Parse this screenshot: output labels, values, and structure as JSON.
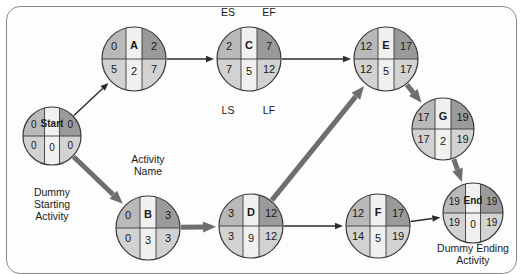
{
  "diagram": {
    "type": "pert-cpm-activity-on-node-network",
    "colors": {
      "quadrant_top_left": "#b9b9b9",
      "quadrant_top_right": "#9a9a9a",
      "quadrant_bottom_left": "#d2d2d2",
      "quadrant_bottom_right": "#d2d2d2",
      "center_band": "#f0f0ee",
      "node_outline": "#3a3a3a",
      "edge_normal": "#2b2b2b",
      "edge_critical": "#6e6e6e",
      "frame_border": "#8a8a8a",
      "page_background": "#ffffff",
      "text": "#1a1a1a"
    }
  },
  "nodes": [
    {
      "id": "start",
      "name": "Start",
      "duration": "0",
      "es": "0",
      "ef": "0",
      "ls": "0",
      "lf": "0",
      "cx": 52,
      "cy": 136,
      "r": 29,
      "critical": true
    },
    {
      "id": "a",
      "name": "A",
      "duration": "2",
      "es": "0",
      "ef": "2",
      "ls": "5",
      "lf": "7",
      "cx": 134,
      "cy": 59,
      "r": 32,
      "critical": false
    },
    {
      "id": "b",
      "name": "B",
      "duration": "3",
      "es": "0",
      "ef": "3",
      "ls": "0",
      "lf": "3",
      "cx": 148,
      "cy": 228,
      "r": 32,
      "critical": true
    },
    {
      "id": "c",
      "name": "C",
      "duration": "5",
      "es": "2",
      "ef": "7",
      "ls": "7",
      "lf": "12",
      "cx": 249,
      "cy": 59,
      "r": 32,
      "critical": false
    },
    {
      "id": "d",
      "name": "D",
      "duration": "9",
      "es": "3",
      "ef": "12",
      "ls": "3",
      "lf": "12",
      "cx": 251,
      "cy": 226,
      "r": 32,
      "critical": true
    },
    {
      "id": "e",
      "name": "E",
      "duration": "5",
      "es": "12",
      "ef": "17",
      "ls": "12",
      "lf": "17",
      "cx": 386,
      "cy": 59,
      "r": 32,
      "critical": true
    },
    {
      "id": "f",
      "name": "F",
      "duration": "5",
      "es": "12",
      "ef": "17",
      "ls": "14",
      "lf": "19",
      "cx": 378,
      "cy": 226,
      "r": 32,
      "critical": false
    },
    {
      "id": "g",
      "name": "G",
      "duration": "2",
      "es": "17",
      "ef": "19",
      "ls": "17",
      "lf": "19",
      "cx": 443,
      "cy": 129,
      "r": 31,
      "critical": true
    },
    {
      "id": "end",
      "name": "End",
      "duration": "0",
      "es": "19",
      "ef": "19",
      "ls": "19",
      "lf": "19",
      "cx": 473,
      "cy": 213,
      "r": 30,
      "critical": true
    }
  ],
  "edges": [
    {
      "from": "start",
      "to": "a",
      "critical": false
    },
    {
      "from": "start",
      "to": "b",
      "critical": true
    },
    {
      "from": "a",
      "to": "c",
      "critical": false
    },
    {
      "from": "c",
      "to": "e",
      "critical": false
    },
    {
      "from": "b",
      "to": "d",
      "critical": true
    },
    {
      "from": "d",
      "to": "e",
      "critical": true
    },
    {
      "from": "d",
      "to": "f",
      "critical": false
    },
    {
      "from": "e",
      "to": "g",
      "critical": true
    },
    {
      "from": "g",
      "to": "end",
      "critical": true
    },
    {
      "from": "f",
      "to": "end",
      "critical": false
    }
  ],
  "annotations": {
    "es_label": "ES",
    "ef_label": "EF",
    "ls_label": "LS",
    "lf_label": "LF",
    "activity_name_label": "Activity\nName",
    "dummy_start_label": "Dummy\nStarting\nActivity",
    "dummy_end_label": "Dummy Ending\nActivity"
  }
}
